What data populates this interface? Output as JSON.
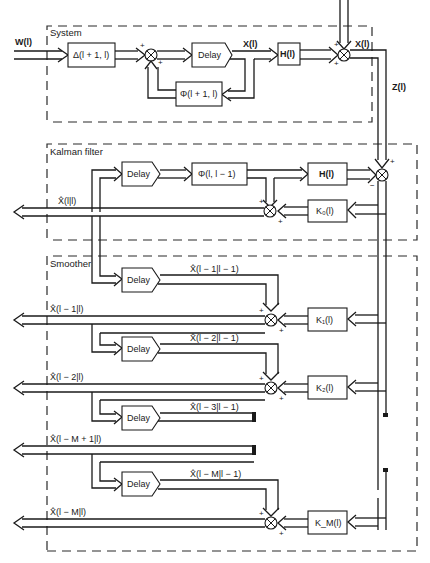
{
  "figure": {
    "type": "block-diagram"
  },
  "sections": {
    "system": "System",
    "kalman": "Kalman filter",
    "smoother": "Smoother"
  },
  "signals": {
    "input_w": "W(l)",
    "state_x": "X(l)",
    "noise_v": "X(l)",
    "measurement_z": "Z(l)",
    "est_l_l": "X̂(l|l)",
    "est_l1_l": "X̂(l − 1|l)",
    "est_l2_l": "X̂(l − 2|l)",
    "est_lm1_l": "X̂(l − M + 1|l)",
    "est_lm_l": "X̂(l − M|l)",
    "pred_l1_l1": "X̂(l − 1|l − 1)",
    "pred_l2_l1": "X̂(l − 2|l − 1)",
    "pred_l3_l1": "X̂(l − 3|l − 1)",
    "pred_lm_l1": "X̂(l − M|l − 1)"
  },
  "blocks": {
    "delta": "Δ(l + 1, l)",
    "delay": "Delay",
    "phi_sys": "Φ(l + 1, l)",
    "h_sys": "H(l)",
    "phi_kf": "Φ(l, l − 1)",
    "h_kf": "H(l)",
    "k0": "K₀(l)",
    "k1": "K₁(l)",
    "k2": "K₂(l)",
    "km": "K_M(l)"
  },
  "signs": {
    "plus": "+",
    "minus": "−"
  }
}
